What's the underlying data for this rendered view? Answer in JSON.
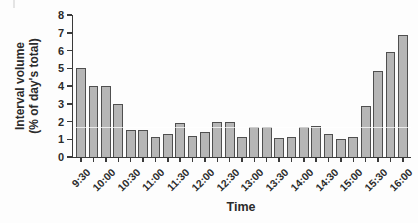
{
  "page": {
    "background": "#fdfdfd"
  },
  "chart_data": {
    "type": "bar",
    "title": "",
    "xlabel": "Time",
    "ylabel": "Interval volume (% of day's total)",
    "ylabel_lines": [
      "Interval volume",
      "(% of day's total)"
    ],
    "categories": [
      "9:30",
      "9:45",
      "10:00",
      "10:15",
      "10:30",
      "10:45",
      "11:00",
      "11:15",
      "11:30",
      "11:45",
      "12:00",
      "12:15",
      "12:30",
      "12:45",
      "13:00",
      "13:15",
      "13:30",
      "13:45",
      "14:00",
      "14:15",
      "14:30",
      "14:45",
      "15:00",
      "15:15",
      "15:30",
      "15:45",
      "16:00"
    ],
    "values": [
      5.0,
      4.0,
      4.0,
      3.0,
      1.5,
      1.5,
      1.15,
      1.3,
      1.9,
      1.2,
      1.4,
      2.0,
      2.0,
      1.1,
      1.7,
      1.7,
      1.05,
      1.15,
      1.7,
      1.75,
      1.3,
      1.0,
      1.1,
      2.9,
      4.85,
      5.9,
      6.85
    ],
    "ylim": [
      0,
      8
    ],
    "ytick_step": 1,
    "ytick_labels": [
      "0",
      "1",
      "2",
      "3",
      "4",
      "5",
      "6",
      "7",
      "8"
    ],
    "x_tick_labels_shown": [
      "9:30",
      "10:00",
      "10:30",
      "11:00",
      "11:30",
      "12:00",
      "12:30",
      "13:00",
      "13:30",
      "14:00",
      "14:30",
      "15:00",
      "15:30",
      "16:00"
    ],
    "x_label_every": 2,
    "grid": false,
    "legend": "none",
    "colors": {
      "bar_fill": "#b6b6b6",
      "bar_border": "#4f4f4f",
      "axis": "#3a3a3a",
      "text": "#2b2b2b"
    }
  }
}
